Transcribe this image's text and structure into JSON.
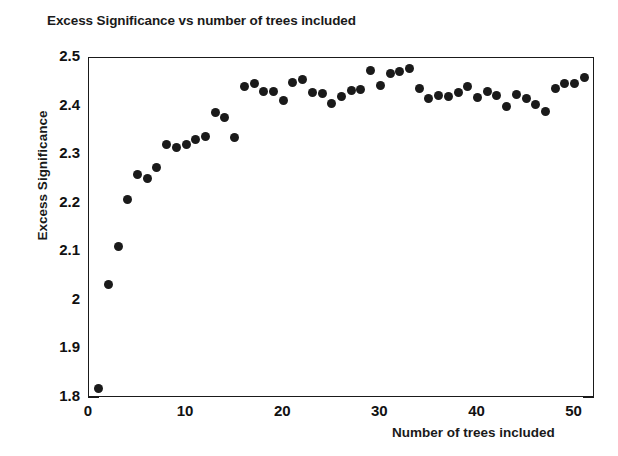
{
  "chart_data": {
    "type": "scatter",
    "title": "Excess Significance vs number of trees included",
    "xlabel": "Number of trees included",
    "ylabel": "Excess Significance",
    "xlim": [
      0,
      52.1
    ],
    "ylim": [
      1.8,
      2.5
    ],
    "xticks": [
      0,
      10,
      20,
      30,
      40,
      50
    ],
    "xtick_labels": [
      "0",
      "10",
      "20",
      "30",
      "40",
      "50"
    ],
    "xtick_minor_step": 2,
    "yticks": [
      1.8,
      1.9,
      2.0,
      2.1,
      2.2,
      2.3,
      2.4,
      2.5
    ],
    "ytick_labels": [
      "1.8",
      "1.9",
      "2",
      "2.1",
      "2.2",
      "2.3",
      "2.4",
      "2.5"
    ],
    "ytick_minor_step": 0.02,
    "grid": false,
    "legend": null,
    "marker": "filled-circle",
    "marker_color": "#1a1a1a",
    "marker_size_px": 9,
    "x": [
      1,
      2,
      3,
      4,
      5,
      6,
      7,
      8,
      9,
      10,
      11,
      12,
      13,
      14,
      15,
      16,
      17,
      18,
      19,
      20,
      21,
      22,
      23,
      24,
      25,
      26,
      27,
      28,
      29,
      30,
      31,
      32,
      33,
      34,
      35,
      36,
      37,
      38,
      39,
      40,
      41,
      42,
      43,
      44,
      45,
      46,
      47,
      48,
      49,
      50,
      51
    ],
    "y": [
      1.82,
      2.033,
      2.111,
      2.209,
      2.26,
      2.251,
      2.274,
      2.322,
      2.315,
      2.321,
      2.332,
      2.338,
      2.388,
      2.378,
      2.337,
      2.441,
      2.447,
      2.431,
      2.432,
      2.412,
      2.45,
      2.456,
      2.429,
      2.426,
      2.407,
      2.421,
      2.433,
      2.436,
      2.474,
      2.443,
      2.468,
      2.473,
      2.478,
      2.437,
      2.416,
      2.423,
      2.42,
      2.429,
      2.441,
      2.418,
      2.432,
      2.422,
      2.4,
      2.425,
      2.417,
      2.405,
      2.39,
      2.438,
      2.448,
      2.447,
      2.46
    ]
  },
  "axis": {
    "x_title": "Number of trees included",
    "y_title": "Excess Significance"
  }
}
